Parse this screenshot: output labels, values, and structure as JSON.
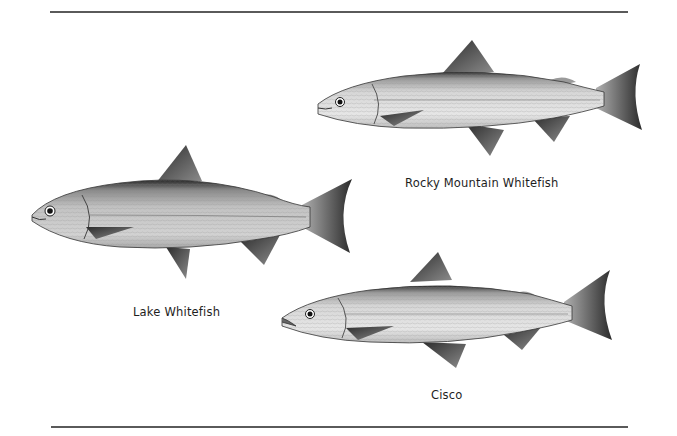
{
  "plate": {
    "background": "#ffffff",
    "rule_color": "#5a5a5a"
  },
  "fish": [
    {
      "id": "rocky-mountain-whitefish",
      "label": "Rocky Mountain Whitefish"
    },
    {
      "id": "lake-whitefish",
      "label": "Lake Whitefish"
    },
    {
      "id": "cisco",
      "label": "Cisco"
    }
  ]
}
